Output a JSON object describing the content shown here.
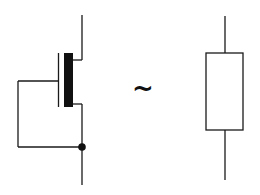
{
  "diagram": {
    "left_symbol": {
      "name": "diode-connected-mosfet",
      "stroke_color": "#1a1a1a",
      "channel_color": "#111111"
    },
    "equivalence_symbol": "~",
    "right_symbol": {
      "name": "resistor",
      "stroke_color": "#1a1a1a",
      "fill_color": "#ffffff"
    }
  }
}
